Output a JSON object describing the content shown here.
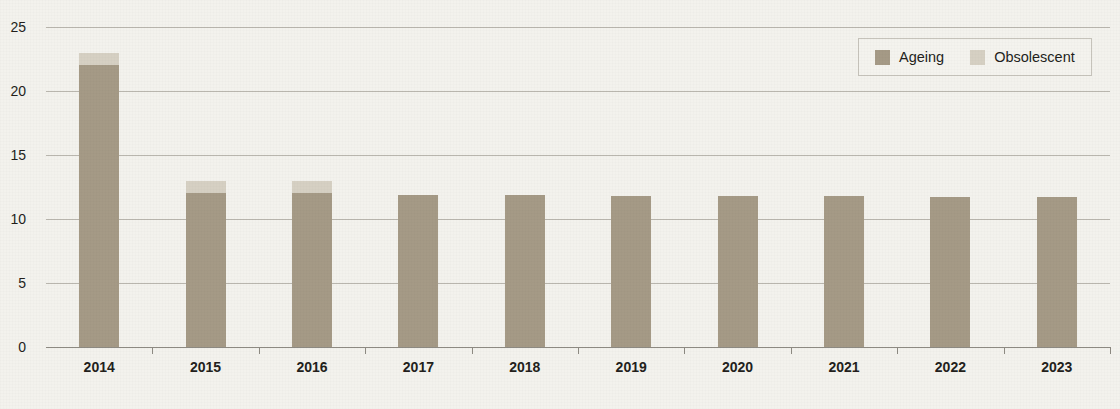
{
  "chart_data": {
    "type": "bar",
    "subtype": "stacked-vertical",
    "title": "",
    "xlabel": "",
    "ylabel": "",
    "categories": [
      "2014",
      "2015",
      "2016",
      "2017",
      "2018",
      "2019",
      "2020",
      "2021",
      "2022",
      "2023"
    ],
    "series": [
      {
        "name": "Ageing",
        "color": "#a59a86",
        "values": [
          22,
          12,
          12,
          11.9,
          11.9,
          11.8,
          11.8,
          11.8,
          11.7,
          11.7
        ]
      },
      {
        "name": "Obsolescent",
        "color": "#d6d0c3",
        "values": [
          1,
          1,
          1,
          0,
          0,
          0,
          0,
          0,
          0,
          0
        ]
      }
    ],
    "totals": [
      23,
      13,
      13,
      11.9,
      11.9,
      11.8,
      11.8,
      11.8,
      11.7,
      11.7
    ],
    "ylim": [
      0,
      25
    ],
    "yticks": [
      0,
      5,
      10,
      15,
      20,
      25
    ],
    "ytick_labels": [
      "0",
      "5",
      "10",
      "15",
      "20",
      "25"
    ],
    "grid": true,
    "legend_position": "top-right"
  },
  "legend": {
    "entries": [
      {
        "label": "Ageing",
        "color": "#a59a86",
        "swatch_name": "legend-swatch-ageing"
      },
      {
        "label": "Obsolescent",
        "color": "#d6d0c3",
        "swatch_name": "legend-swatch-obsolescent"
      }
    ]
  },
  "colors": {
    "background": "#f3f2ed",
    "ageing": "#a59a86",
    "obsolescent": "#d6d0c3",
    "gridline": "#b9b6ae",
    "axis": "#8d8a82",
    "text": "#231f1c"
  }
}
